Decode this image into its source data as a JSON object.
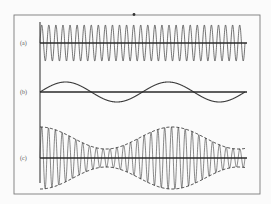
{
  "figure": {
    "frame": {
      "x": 14,
      "y": 15,
      "width": 246,
      "height": 179,
      "stroke": "#7a7a7a"
    },
    "marker_dot": {
      "x": 134,
      "y": 14.5,
      "r": 1.4
    },
    "axis": {
      "x": 40,
      "y_top": 22,
      "y_bottom": 183
    },
    "line_color": "#2a2a2a",
    "wave_color": "#3a3a3a",
    "panels": [
      {
        "id": "a",
        "label": "(a)",
        "description": "carrier wave",
        "baseline_y": 43,
        "x_start": 40,
        "x_end": 245,
        "amplitude": 18,
        "cycles": 29,
        "type": "sine"
      },
      {
        "id": "b",
        "label": "(b)",
        "description": "modulating signal",
        "baseline_y": 92,
        "x_start": 40,
        "x_end": 245,
        "amplitude": 10,
        "cycles": 2,
        "type": "sine"
      },
      {
        "id": "c",
        "label": "(c)",
        "description": "amplitude-modulated wave with dashed envelope",
        "baseline_y": 158,
        "x_start": 40,
        "x_end": 245,
        "carrier_cycles": 30,
        "envelope": {
          "base_amplitude": 20,
          "modulation_depth": 11,
          "cycles": 1.55,
          "phase_deg": 90,
          "dashed": true
        },
        "type": "am"
      }
    ]
  }
}
